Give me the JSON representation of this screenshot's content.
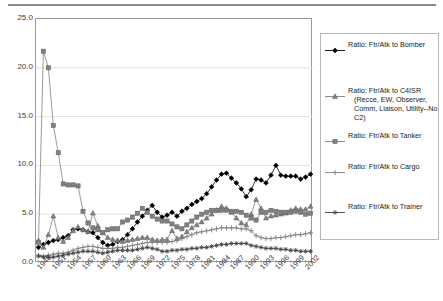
{
  "chart_data": {
    "type": "line",
    "title": "",
    "xlabel": "",
    "ylabel": "",
    "ylim": [
      0.0,
      25.0
    ],
    "yticks": [
      "0.0",
      "5.0",
      "10.0",
      "15.0",
      "20.0",
      "25.0"
    ],
    "ytick_values": [
      0.0,
      5.0,
      10.0,
      15.0,
      20.0,
      25.0
    ],
    "grid": true,
    "legend_position": "right",
    "x_start_year": 1948,
    "x_end_year": 2003,
    "xticks": [
      "1948",
      "1951",
      "1954",
      "1957",
      "1960",
      "1963",
      "1966",
      "1969",
      "1972",
      "1975",
      "1978",
      "1981",
      "1984",
      "1987",
      "1990",
      "1993",
      "1996",
      "1999",
      "2002"
    ],
    "x": [
      1948,
      1949,
      1950,
      1951,
      1952,
      1953,
      1954,
      1955,
      1956,
      1957,
      1958,
      1959,
      1960,
      1961,
      1962,
      1963,
      1964,
      1965,
      1966,
      1967,
      1968,
      1969,
      1970,
      1971,
      1972,
      1973,
      1974,
      1975,
      1976,
      1977,
      1978,
      1979,
      1980,
      1981,
      1982,
      1983,
      1984,
      1985,
      1986,
      1987,
      1988,
      1989,
      1990,
      1991,
      1992,
      1993,
      1994,
      1995,
      1996,
      1997,
      1998,
      1999,
      2000,
      2001,
      2002,
      2003
    ],
    "series": [
      {
        "name": "Ratio: Ftr/Atk to Bomber",
        "marker": "diamond",
        "color": "#000000",
        "values": [
          1.6,
          1.9,
          2.1,
          2.3,
          2.4,
          2.6,
          2.8,
          3.4,
          3.5,
          3.4,
          3.2,
          3.1,
          2.6,
          2.1,
          1.8,
          1.9,
          2.2,
          2.4,
          2.9,
          3.5,
          4.2,
          4.8,
          5.4,
          5.9,
          5.2,
          4.7,
          4.9,
          5.2,
          4.8,
          5.3,
          5.6,
          6.0,
          6.3,
          6.6,
          7.1,
          7.8,
          8.5,
          9.1,
          9.2,
          8.7,
          8.2,
          7.6,
          6.8,
          7.5,
          8.6,
          8.5,
          8.2,
          9.0,
          10.0,
          9.0,
          8.9,
          8.9,
          8.9,
          8.6,
          8.8,
          9.1
        ]
      },
      {
        "name": "Ratio: Ftr/Atk to C4ISR (Recce, EW, Observer, Comm, Liaison, Utility--No C2)",
        "marker": "triangle",
        "color": "#808080",
        "values": [
          2.3,
          1.6,
          2.9,
          4.8,
          2.6,
          2.2,
          2.6,
          3.3,
          3.7,
          3.4,
          3.2,
          5.1,
          3.8,
          3.1,
          2.6,
          2.4,
          2.3,
          2.2,
          2.3,
          2.4,
          2.5,
          2.6,
          2.6,
          2.4,
          2.3,
          2.4,
          2.4,
          3.3,
          2.5,
          2.7,
          3.2,
          3.6,
          3.9,
          4.2,
          4.6,
          5.0,
          5.4,
          5.8,
          5.6,
          5.2,
          4.6,
          4.1,
          3.9,
          5.0,
          6.5,
          5.6,
          4.6,
          4.8,
          4.9,
          5.0,
          5.1,
          5.4,
          5.6,
          5.5,
          5.5,
          5.8
        ]
      },
      {
        "name": "Ratio: Ftr/Atk to Tanker",
        "marker": "square",
        "color": "#808080",
        "values": [
          2.1,
          21.7,
          20.0,
          14.1,
          11.3,
          8.1,
          8.0,
          8.0,
          7.9,
          5.3,
          4.1,
          3.6,
          3.4,
          3.1,
          3.4,
          3.5,
          3.5,
          4.2,
          4.4,
          4.7,
          5.1,
          5.6,
          5.2,
          4.8,
          4.5,
          4.3,
          4.3,
          4.0,
          3.7,
          3.5,
          3.9,
          4.3,
          4.7,
          5.0,
          5.2,
          5.4,
          5.4,
          5.4,
          5.4,
          5.3,
          5.3,
          5.2,
          4.9,
          4.6,
          4.4,
          5.2,
          5.2,
          5.4,
          5.3,
          5.2,
          5.2,
          5.2,
          5.3,
          5.2,
          5.0,
          5.1
        ]
      },
      {
        "name": "Ratio: Ftr/Atk to Cargo",
        "marker": "plus",
        "color": "#808080",
        "values": [
          0.8,
          0.7,
          0.8,
          0.9,
          1.0,
          1.0,
          1.1,
          1.3,
          1.5,
          1.6,
          1.7,
          1.7,
          1.6,
          1.5,
          1.5,
          1.5,
          1.6,
          1.6,
          1.7,
          1.8,
          1.9,
          2.0,
          2.1,
          2.1,
          2.1,
          2.1,
          2.1,
          2.2,
          2.3,
          2.5,
          2.7,
          2.9,
          3.1,
          3.2,
          3.3,
          3.4,
          3.5,
          3.6,
          3.6,
          3.6,
          3.6,
          3.5,
          3.5,
          3.3,
          2.8,
          2.6,
          2.5,
          2.5,
          2.6,
          2.6,
          2.7,
          2.8,
          2.9,
          2.9,
          3.0,
          3.1
        ]
      },
      {
        "name": "Ratio: Ftr/Atk to Trainer",
        "marker": "asterisk",
        "color": "#404040",
        "values": [
          0.7,
          0.6,
          0.6,
          0.6,
          0.7,
          0.8,
          0.9,
          1.0,
          1.1,
          1.2,
          1.2,
          1.2,
          1.1,
          1.0,
          1.1,
          1.2,
          1.3,
          1.3,
          1.3,
          1.3,
          1.4,
          1.5,
          1.6,
          1.5,
          1.4,
          1.2,
          1.2,
          1.3,
          1.3,
          1.4,
          1.4,
          1.5,
          1.5,
          1.6,
          1.6,
          1.7,
          1.8,
          1.9,
          1.9,
          2.0,
          2.0,
          2.0,
          2.0,
          1.8,
          1.7,
          1.6,
          1.5,
          1.5,
          1.5,
          1.4,
          1.4,
          1.3,
          1.3,
          1.2,
          1.2,
          1.2
        ]
      }
    ]
  },
  "legend": {
    "entries": [
      {
        "label": "Ratio: Ftr/Atk to Bomber",
        "cont1": "",
        "cont2": "",
        "cont3": ""
      },
      {
        "label": "Ratio: Ftr/Atk to C4ISR",
        "cont1": "(Recce, EW, Observer,",
        "cont2": "Comm, Liaison, Utility--No",
        "cont3": "C2)"
      },
      {
        "label": "Ratio: Ftr/Atk to Tanker",
        "cont1": "",
        "cont2": "",
        "cont3": ""
      },
      {
        "label": "Ratio: Ftr/Atk to Cargo",
        "cont1": "",
        "cont2": "",
        "cont3": ""
      },
      {
        "label": "Ratio: Ftr/Atk to Trainer",
        "cont1": "",
        "cont2": "",
        "cont3": ""
      }
    ]
  }
}
